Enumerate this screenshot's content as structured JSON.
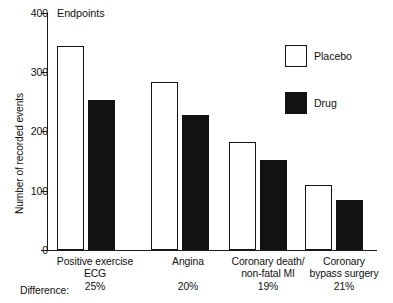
{
  "chart_data": {
    "type": "bar",
    "title": "Endpoints",
    "xlabel": "",
    "ylabel": "Number of recorded events",
    "ylim": [
      0,
      400
    ],
    "yticks": [
      0,
      100,
      200,
      300,
      400
    ],
    "ytick_labels": [
      "0",
      "100",
      "200",
      "300",
      "400"
    ],
    "grid": false,
    "legend_position": "upper right",
    "categories": [
      "Positive exercise ECG",
      "Angina",
      "Coronary death/ non-fatal MI",
      "Coronary bypass surgery"
    ],
    "category_lines": [
      [
        "Positive exercise",
        "ECG"
      ],
      [
        "Angina"
      ],
      [
        "Coronary death/",
        "non-fatal MI"
      ],
      [
        "Coronary",
        "bypass surgery"
      ]
    ],
    "series": [
      {
        "name": "Placebo",
        "color": "#ffffff",
        "values": [
          345,
          284,
          182,
          110
        ]
      },
      {
        "name": "Drug",
        "color": "#121212",
        "values": [
          253,
          228,
          152,
          85
        ]
      }
    ],
    "annotations": {
      "difference_prefix": "Difference:",
      "difference_values": [
        "25%",
        "20%",
        "19%",
        "21%"
      ]
    }
  }
}
